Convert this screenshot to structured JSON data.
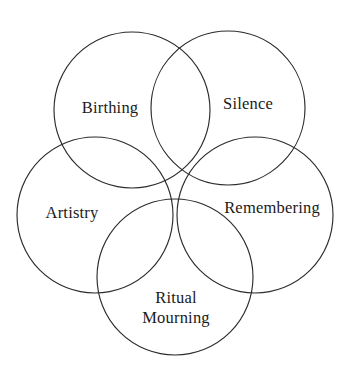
{
  "diagram": {
    "type": "venn-five-circle",
    "title": "",
    "canvas": {
      "width": 359,
      "height": 384,
      "background": "#ffffff"
    },
    "stroke_color": "#2b2b2b",
    "text_color": "#1a1a1a",
    "circles": [
      {
        "id": "birthing",
        "label": "Birthing",
        "cx": 132,
        "cy": 110,
        "r": 78,
        "label_x": 110,
        "label_y": 108
      },
      {
        "id": "silence",
        "label": "Silence",
        "cx": 228,
        "cy": 108,
        "r": 77,
        "label_x": 248,
        "label_y": 104
      },
      {
        "id": "artistry",
        "label": "Artistry",
        "cx": 95,
        "cy": 215,
        "r": 78,
        "label_x": 72,
        "label_y": 213
      },
      {
        "id": "remembering",
        "label": "Remembering",
        "cx": 255,
        "cy": 215,
        "r": 78,
        "label_x": 272,
        "label_y": 208
      },
      {
        "id": "ritual-mourning",
        "label": "Ritual\nMourning",
        "cx": 175,
        "cy": 277,
        "r": 78,
        "label_x": 176,
        "label_y": 308
      }
    ]
  }
}
